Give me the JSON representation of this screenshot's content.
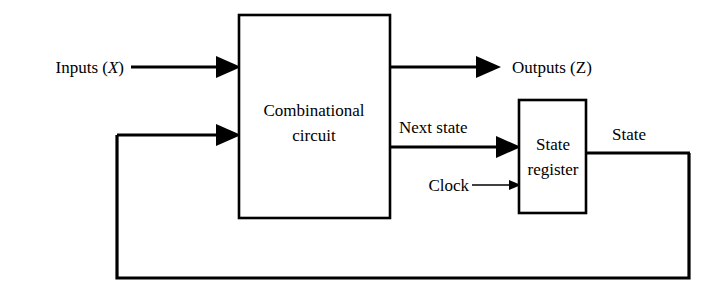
{
  "diagram": {
    "background_color": "#ffffff",
    "line_color": "#000000",
    "blocks": [
      {
        "id": "combinational-circuit",
        "label_line1": "Combinational",
        "label_line2": "circuit",
        "x": 239,
        "y": 15,
        "width": 151,
        "height": 203
      },
      {
        "id": "state-register",
        "label_line1": "State",
        "label_line2": "register",
        "x": 519,
        "y": 100,
        "width": 67,
        "height": 113
      }
    ],
    "signals": {
      "inputs": {
        "label_text": "Inputs (",
        "label_var": "X",
        "label_close": ")"
      },
      "outputs": {
        "label_text": "Outputs (",
        "label_var": "Z",
        "label_close": ")"
      },
      "next_state": {
        "label": "Next state"
      },
      "state": {
        "label": "State"
      },
      "clock": {
        "label": "Clock"
      }
    }
  }
}
